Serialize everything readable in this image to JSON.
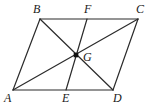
{
  "figure": {
    "canvas": {
      "width": 154,
      "height": 107,
      "background": "#ffffff"
    },
    "style": {
      "stroke_color": "#2b2b2b",
      "stroke_width": 1.2,
      "point_color": "#111111",
      "label_color": "#1a1a1a",
      "label_font_size": 12
    },
    "points": {
      "A": {
        "label": "A",
        "x": 13,
        "y": 90,
        "label_x": 4,
        "label_y": 92
      },
      "B": {
        "label": "B",
        "x": 40,
        "y": 19,
        "label_x": 33,
        "label_y": 3
      },
      "C": {
        "label": "C",
        "x": 138,
        "y": 19,
        "label_x": 136,
        "label_y": 3
      },
      "D": {
        "label": "D",
        "x": 113,
        "y": 90,
        "label_x": 113,
        "label_y": 92
      },
      "E": {
        "label": "E",
        "x": 66,
        "y": 90,
        "label_x": 62,
        "label_y": 92
      },
      "F": {
        "label": "F",
        "x": 87,
        "y": 19,
        "label_x": 84,
        "label_y": 3
      },
      "G": {
        "label": "G",
        "x": 76,
        "y": 55,
        "label_x": 83,
        "label_y": 51
      }
    },
    "segments": [
      {
        "name": "side-AB",
        "from": "A",
        "to": "B"
      },
      {
        "name": "side-BC",
        "from": "B",
        "to": "C"
      },
      {
        "name": "side-CD",
        "from": "C",
        "to": "D"
      },
      {
        "name": "side-DA",
        "from": "D",
        "to": "A"
      },
      {
        "name": "diagonal-AC",
        "from": "A",
        "to": "C"
      },
      {
        "name": "diagonal-BD",
        "from": "B",
        "to": "D"
      },
      {
        "name": "segment-FE",
        "from": "F",
        "to": "E"
      }
    ],
    "marked_points": [
      "G"
    ]
  }
}
